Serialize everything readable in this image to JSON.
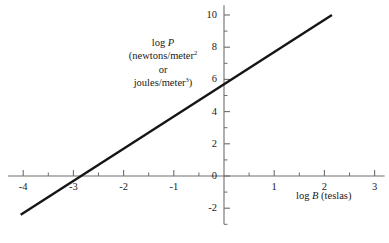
{
  "chart_data": {
    "type": "line",
    "title": "",
    "xlabel": "log B  (teslas)",
    "ylabel": "log P (newtons/meter² or joules/meter³)",
    "xlim": [
      -4.3,
      3.2
    ],
    "ylim": [
      -3.0,
      10.6
    ],
    "grid": false,
    "legend": null,
    "series": [
      {
        "name": "log P vs log B",
        "slope": 2.0,
        "intercept": 5.7,
        "x": [
          -4.05,
          2.15
        ],
        "y": [
          -2.4,
          10.0
        ],
        "points": [
          {
            "x": -4.05,
            "y": -2.4
          },
          {
            "x": -2.85,
            "y": 0.0
          },
          {
            "x": 0.0,
            "y": 5.7
          },
          {
            "x": 2.15,
            "y": 10.0
          }
        ]
      }
    ],
    "x_major_ticks": [
      -4,
      -3,
      -2,
      -1,
      0,
      1,
      2,
      3
    ],
    "x_major_tick_labels": [
      "-4",
      "-3",
      "-2",
      "-1",
      "0",
      "1",
      "2",
      "3"
    ],
    "x_minor_ticks": [
      -3.5,
      -2.5,
      -1.5,
      -0.5,
      0.5,
      1.5,
      2.5
    ],
    "y_major_ticks": [
      -2,
      0,
      2,
      4,
      6,
      8,
      10
    ],
    "y_major_tick_labels": [
      "-2",
      "0",
      "2",
      "4",
      "6",
      "8",
      "10"
    ],
    "y_minor_ticks": [
      -3,
      -1,
      1,
      3,
      5,
      7,
      9
    ],
    "colors": {
      "line": "#151515",
      "axis": "#6e6e6e",
      "text": "#1a1a1a",
      "background": "#ffffff"
    }
  },
  "axes": {
    "y_label_line1_prefix": "log ",
    "y_label_line1_symbol": "P",
    "y_label_line2_prefix": "(newtons/meter",
    "y_label_line2_sup": "2",
    "y_label_line3": "or",
    "y_label_line4_prefix": "joules/meter",
    "y_label_line4_sup": "3",
    "y_label_line4_suffix": ")",
    "x_label_prefix": "log ",
    "x_label_symbol": "B",
    "x_label_suffix": "  (teslas)"
  },
  "caption": {
    "text": ""
  }
}
